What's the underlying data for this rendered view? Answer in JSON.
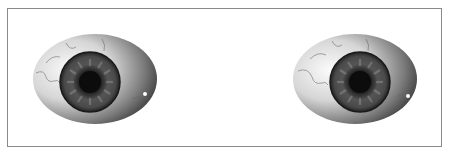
{
  "scene": {
    "description": "Two cartoon eyeballs side by side inside a thin bordered frame",
    "frame_color": "#8a8a8a",
    "background": "#ffffff"
  },
  "eyes": [
    {
      "name": "left-eye",
      "sclera_light": "#f4f4f4",
      "sclera_dark": "#4a4a4a",
      "iris_color": "#5a5a5a",
      "pupil_color": "#111111",
      "iris_offset_x": -5,
      "iris_offset_y": 3
    },
    {
      "name": "right-eye",
      "sclera_light": "#f4f4f4",
      "sclera_dark": "#4a4a4a",
      "iris_color": "#5a5a5a",
      "pupil_color": "#111111",
      "iris_offset_x": 5,
      "iris_offset_y": 3
    }
  ]
}
